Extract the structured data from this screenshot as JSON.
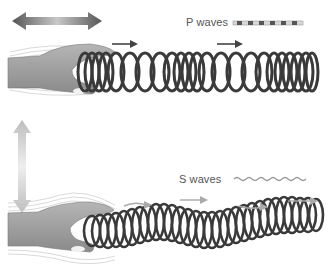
{
  "diagram": {
    "panels": [
      {
        "id": "p-waves",
        "legend_label": "P waves",
        "motion": "horizontal push-pull (compression)",
        "direction_arrows": 2
      },
      {
        "id": "s-waves",
        "legend_label": "S waves",
        "motion": "vertical up-down (shear)",
        "direction_arrows": 3
      }
    ],
    "colors": {
      "coil": "#333333",
      "hand": "#9a9a9a",
      "arrow_dark": "#444444",
      "arrow_light": "#b0b0b0",
      "text": "#555555"
    }
  }
}
